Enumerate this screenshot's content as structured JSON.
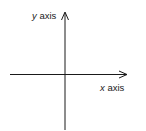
{
  "diagram": {
    "x_axis": {
      "label_var": "x",
      "label_word": " axis",
      "arrow": "right"
    },
    "y_axis": {
      "label_var": "y",
      "label_word": " axis",
      "arrow": "up"
    },
    "colors": {
      "line": "#1a1a1a",
      "text": "#222222",
      "background": "#ffffff"
    }
  }
}
